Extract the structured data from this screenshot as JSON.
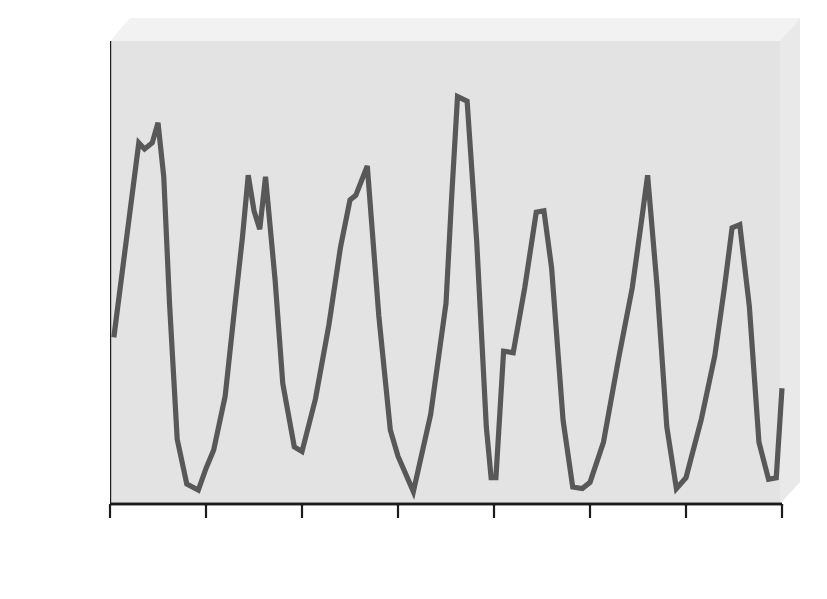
{
  "chart_data": {
    "type": "line",
    "title": "",
    "xlabel": "Year",
    "ylabel": "Reported cases per 100,000 population",
    "xlim": [
      1984.0,
      1991.0
    ],
    "ylim": [
      0,
      30
    ],
    "yticks": [
      0,
      5,
      10,
      15,
      20,
      25,
      30
    ],
    "xticks": [
      1984,
      1985,
      1986,
      1987,
      1988,
      1989,
      1990,
      1991
    ],
    "ytick_labels": [
      "0",
      "5",
      "10",
      "15",
      "20",
      "25",
      "30"
    ],
    "xtick_labels": [
      "1984",
      "1985",
      "1986",
      "1987",
      "1988",
      "1989",
      "1990",
      "1991"
    ],
    "grid": false,
    "legend": null,
    "line_color": "#585858",
    "plot_background": "#e3e3e3",
    "series": [
      {
        "name": "Reported cases per 100,000 population",
        "x": [
          1984.04,
          1984.3,
          1984.36,
          1984.44,
          1984.5,
          1984.56,
          1984.62,
          1984.7,
          1984.8,
          1984.92,
          1985.0,
          1985.08,
          1985.2,
          1985.3,
          1985.38,
          1985.44,
          1985.5,
          1985.56,
          1985.62,
          1985.72,
          1985.8,
          1985.92,
          1986.0,
          1986.14,
          1986.28,
          1986.4,
          1986.5,
          1986.56,
          1986.68,
          1986.8,
          1986.92,
          1987.0,
          1987.16,
          1987.34,
          1987.5,
          1987.56,
          1987.62,
          1987.72,
          1987.82,
          1987.92,
          1987.97,
          1988.02,
          1988.1,
          1988.2,
          1988.32,
          1988.44,
          1988.52,
          1988.6,
          1988.72,
          1988.82,
          1988.92,
          1989.0,
          1989.14,
          1989.3,
          1989.44,
          1989.54,
          1989.6,
          1989.7,
          1989.8,
          1989.9,
          1990.0,
          1990.16,
          1990.3,
          1990.4,
          1990.48,
          1990.56,
          1990.66,
          1990.76,
          1990.86,
          1990.94,
          1991.0
        ],
        "y": [
          10.8,
          23.4,
          23.0,
          23.4,
          24.7,
          21.2,
          13.0,
          4.2,
          1.3,
          0.9,
          2.3,
          3.5,
          7.0,
          12.8,
          17.3,
          21.3,
          19.0,
          17.8,
          21.2,
          14.5,
          7.8,
          3.7,
          3.4,
          6.8,
          11.6,
          16.6,
          19.7,
          20.0,
          21.9,
          12.2,
          4.8,
          3.1,
          0.8,
          5.8,
          13.0,
          20.0,
          26.4,
          26.1,
          17.0,
          5.0,
          1.7,
          1.7,
          9.9,
          9.8,
          14.0,
          18.9,
          19.0,
          15.3,
          5.4,
          1.1,
          1.0,
          1.4,
          4.0,
          9.5,
          14.0,
          18.5,
          21.3,
          14.0,
          5.0,
          1.0,
          1.7,
          5.5,
          9.6,
          14.0,
          17.9,
          18.1,
          12.8,
          4.0,
          1.6,
          1.7,
          7.5
        ]
      }
    ]
  },
  "axes": {
    "ylabel_text": "Reported cases per 100,000 population",
    "xlabel_text": "Year"
  }
}
